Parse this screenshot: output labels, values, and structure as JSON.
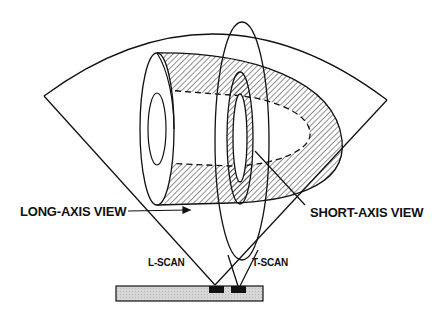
{
  "diagram": {
    "labels": {
      "long_axis": "LONG-AXIS VIEW",
      "short_axis": "SHORT-AXIS VIEW",
      "l_scan": "L-SCAN",
      "t_scan": "T-SCAN"
    },
    "colors": {
      "line": "#111111",
      "transducer_fill": "#d4d4d4",
      "hatch": "#222222"
    }
  }
}
